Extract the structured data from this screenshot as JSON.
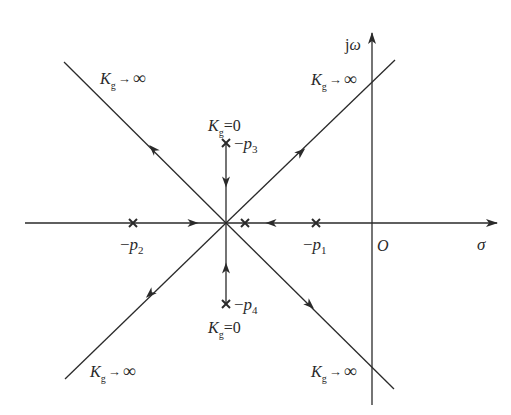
{
  "diagram": {
    "type": "root-locus",
    "colors": {
      "line": "#2a2a2a",
      "text": "#2a2a2a",
      "background": "#ffffff"
    },
    "axes": {
      "real_label": "σ",
      "imag_label": "jω",
      "origin_label": "O",
      "origin": [
        372,
        223
      ],
      "real_axis": {
        "x1": 25,
        "x2": 497,
        "y": 223
      },
      "imag_axis": {
        "x": 372,
        "y1": 405,
        "y2": 33
      }
    },
    "center": [
      226,
      223
    ],
    "poles": [
      {
        "id": "p1",
        "label_prefix": "−p",
        "label_sub": "1",
        "x": 316,
        "y": 223,
        "label_x": 303,
        "label_y": 250
      },
      {
        "id": "p2",
        "label_prefix": "−p",
        "label_sub": "2",
        "x": 133,
        "y": 223,
        "label_x": 120,
        "label_y": 250
      },
      {
        "id": "p3",
        "label_prefix": "−p",
        "label_sub": "3",
        "x": 226,
        "y": 143,
        "label_x": 234,
        "label_y": 149
      },
      {
        "id": "p4",
        "label_prefix": "−p",
        "label_sub": "4",
        "x": 226,
        "y": 304,
        "label_x": 234,
        "label_y": 310
      },
      {
        "id": "p5",
        "label_prefix": "",
        "label_sub": "",
        "x": 245,
        "y": 223,
        "label_x": 0,
        "label_y": 0
      }
    ],
    "asymptotes": [
      {
        "id": "upper-left",
        "x2": 64,
        "y2": 62
      },
      {
        "id": "upper-right",
        "x2": 395,
        "y2": 60
      },
      {
        "id": "lower-left",
        "x2": 65,
        "y2": 379
      },
      {
        "id": "lower-right",
        "x2": 394,
        "y2": 389
      }
    ],
    "labels": {
      "k_infinity": {
        "K": "K",
        "sub": "g",
        "arrow": "→",
        "value": "∞"
      },
      "k_zero": {
        "K": "K",
        "sub": "g",
        "eq": "=0"
      }
    },
    "k_infinity_positions": [
      {
        "id": "upper-left",
        "x": 100,
        "y": 84
      },
      {
        "id": "upper-right",
        "x": 311,
        "y": 85
      },
      {
        "id": "lower-left",
        "x": 90,
        "y": 377
      },
      {
        "id": "lower-right",
        "x": 311,
        "y": 377
      }
    ],
    "k_zero_positions": [
      {
        "id": "top",
        "x": 208,
        "y": 131
      },
      {
        "id": "bottom",
        "x": 208,
        "y": 333
      }
    ]
  }
}
